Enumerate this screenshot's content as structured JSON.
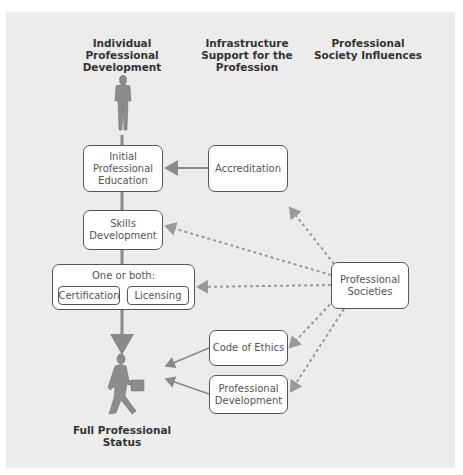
{
  "headers": {
    "col1": "Individual Professional Development",
    "col2": "Infrastructure Support for the Profession",
    "col3": "Professional Society Influences"
  },
  "boxes": {
    "initial_education": "Initial Professional Education",
    "skills_development": "Skills Development",
    "one_or_both": "One or both:",
    "certification": "Certification",
    "licensing": "Licensing",
    "accreditation": "Accreditation",
    "professional_societies": "Professional Societies",
    "code_of_ethics": "Code of Ethics",
    "professional_development": "Professional Development"
  },
  "caption": "Full Professional Status",
  "colors": {
    "panel": "#ececec",
    "line": "#8a8a8a",
    "box_border": "#555555",
    "figure": "#888888"
  }
}
